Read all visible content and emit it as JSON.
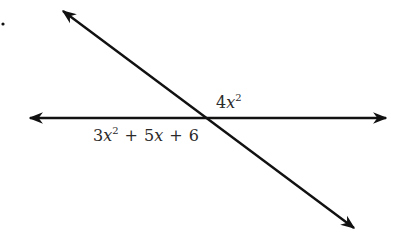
{
  "diagram": {
    "type": "intersecting-lines",
    "marker": ".",
    "lines": [
      {
        "name": "diagonal-line",
        "description": "line from upper-left to lower-right, arrows at both ends"
      },
      {
        "name": "horizontal-line",
        "description": "horizontal line, arrows at both ends"
      }
    ],
    "angle_labels": {
      "upper_right": {
        "coef": "4",
        "var": "x",
        "exp": "2"
      },
      "lower_left": {
        "t1_coef": "3",
        "t1_var": "x",
        "t1_exp": "2",
        "op1": "+",
        "t2": "5x",
        "t2_coef": "5",
        "t2_var": "x",
        "op2": "+",
        "t3": "6"
      }
    },
    "colors": {
      "line": "#111111",
      "text": "#2a2a2a",
      "background": "#ffffff"
    }
  }
}
